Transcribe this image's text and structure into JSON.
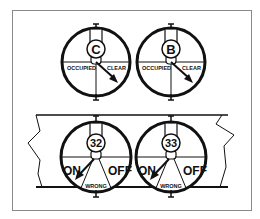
{
  "diagram": {
    "colors": {
      "ink": "#111111",
      "frame": "#8a8a8a",
      "background": "#ffffff"
    },
    "track_indicators": [
      {
        "letter": "C",
        "left_label": "OCCUPIED",
        "right_label": "CLEAR",
        "pointer": "clear"
      },
      {
        "letter": "B",
        "left_label": "OCCUPIED",
        "right_label": "CLEAR",
        "pointer": "clear"
      }
    ],
    "switch_indicators": [
      {
        "number": "32",
        "left_label": "ON",
        "right_label": "OFF",
        "bottom_label": "WRONG",
        "pointer": "on"
      },
      {
        "number": "33",
        "left_label": "ON",
        "right_label": "OFF",
        "bottom_label": "WRONG",
        "pointer": "on"
      }
    ]
  }
}
